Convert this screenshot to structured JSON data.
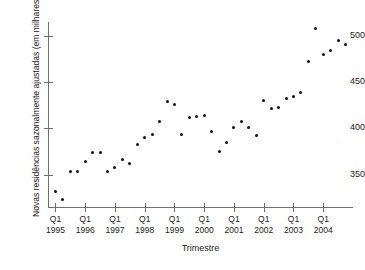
{
  "chart_data": {
    "type": "scatter",
    "title": "",
    "xlabel": "Trimestre",
    "ylabel": "Novas residências sazonalmente ajustadas (em milhares)",
    "grid": false,
    "legend": null,
    "xlim": [
      1994.75,
      2005.0
    ],
    "ylim": [
      315,
      515
    ],
    "y_ticks": [
      350,
      400,
      450,
      500
    ],
    "x_ticks": [
      {
        "quarter": "Q1",
        "year": "1995",
        "x": 1995
      },
      {
        "quarter": "Q1",
        "year": "1996",
        "x": 1996
      },
      {
        "quarter": "Q1",
        "year": "1997",
        "x": 1997
      },
      {
        "quarter": "Q1",
        "year": "1998",
        "x": 1998
      },
      {
        "quarter": "Q1",
        "year": "1999",
        "x": 1999
      },
      {
        "quarter": "Q1",
        "year": "2000",
        "x": 2000
      },
      {
        "quarter": "Q1",
        "year": "2001",
        "x": 2001
      },
      {
        "quarter": "Q1",
        "year": "2002",
        "x": 2002
      },
      {
        "quarter": "Q1",
        "year": "2003",
        "x": 2003
      },
      {
        "quarter": "Q1",
        "year": "2004",
        "x": 2004
      }
    ],
    "x": [
      1995.0,
      1995.25,
      1995.5,
      1995.75,
      1996.0,
      1996.25,
      1996.5,
      1996.75,
      1997.0,
      1997.25,
      1997.5,
      1997.75,
      1998.0,
      1998.25,
      1998.5,
      1998.75,
      1999.0,
      1999.25,
      1999.5,
      1999.75,
      2000.0,
      2000.25,
      2000.5,
      2000.75,
      2001.0,
      2001.25,
      2001.5,
      2001.75,
      2002.0,
      2002.25,
      2002.5,
      2002.75,
      2003.0,
      2003.25,
      2003.5,
      2003.75,
      2004.0,
      2004.25,
      2004.5,
      2004.75
    ],
    "values": [
      332,
      323,
      353,
      353,
      364,
      374,
      374,
      353,
      358,
      366,
      362,
      383,
      390,
      393,
      407,
      429,
      426,
      393,
      412,
      413,
      414,
      397,
      375,
      385,
      401,
      407,
      401,
      392,
      430,
      422,
      423,
      432,
      434,
      439,
      472,
      508,
      480,
      484,
      495,
      491
    ]
  }
}
